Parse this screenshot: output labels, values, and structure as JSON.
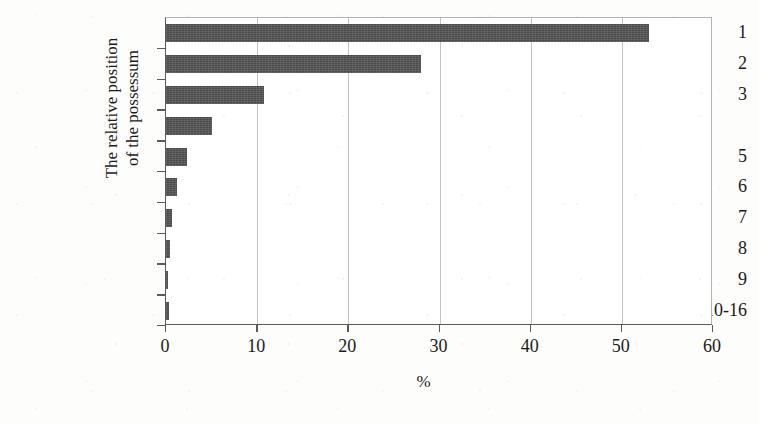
{
  "chart_data": {
    "type": "bar",
    "orientation": "horizontal",
    "title": "",
    "xlabel": "%",
    "ylabel_lines": [
      "The relative position",
      "of the possessum"
    ],
    "categories": [
      "1",
      "2",
      "3",
      "",
      "5",
      "6",
      "7",
      "8",
      "9",
      "10-16"
    ],
    "values": [
      53.0,
      28.0,
      10.8,
      5.0,
      2.3,
      1.2,
      0.7,
      0.4,
      0.2,
      0.3
    ],
    "xlim": [
      0,
      60
    ],
    "xticks": [
      "0",
      "10",
      "20",
      "30",
      "40",
      "50",
      "60"
    ],
    "xtick_values": [
      0,
      10,
      20,
      30,
      40,
      50,
      60
    ],
    "grid": "vertical",
    "legend": "none",
    "bar_color": "#4b4b4b",
    "gridline_color": "#c3c3c3",
    "axis_color": "#5a5a5a",
    "background_color": "#ffffff",
    "note": "The tick label for the fourth category is blank in the scanned source"
  }
}
